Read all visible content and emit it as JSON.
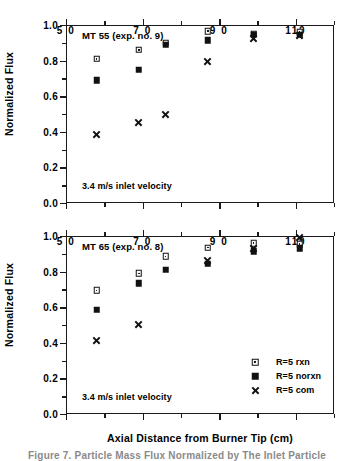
{
  "figure": {
    "caption": "Figure 7. Particle Mass Flux Normalized by The Inlet Particle",
    "xlabel": "Axial  Distance  from  Burner  Tip (cm)",
    "ylabel": "Normalized  Flux"
  },
  "legend": {
    "position": "bottom-right-inside",
    "entries": [
      {
        "label": "R=5 rxn",
        "marker": "open-square"
      },
      {
        "label": "R=5 norxn",
        "marker": "filled-square"
      },
      {
        "label": "R=5 com",
        "marker": "cross-x"
      }
    ]
  },
  "axis": {
    "x_ticks_labeled": [
      "5 0",
      "7 0",
      "9 0",
      "110"
    ],
    "x_tick_values": [
      50,
      70,
      90,
      110
    ],
    "y_ticks_labeled": [
      "0.0",
      "0.2",
      "0.4",
      "0.6",
      "0.8",
      "1.0"
    ],
    "y_tick_values": [
      0.0,
      0.2,
      0.4,
      0.6,
      0.8,
      1.0
    ]
  },
  "chart_data": [
    {
      "type": "scatter",
      "title": "MT 55 (exp. no. 9)",
      "annotation": "3.4 m/s inlet velocity",
      "xlabel": "Axial  Distance  from  Burner  Tip (cm)",
      "ylabel": "Normalized  Flux",
      "xlim": [
        50,
        120
      ],
      "ylim": [
        0.0,
        1.0
      ],
      "grid": false,
      "x": [
        58,
        69,
        76,
        87,
        99,
        111
      ],
      "series": [
        {
          "name": "R=5 rxn",
          "marker": "open-square",
          "values": [
            0.81,
            0.86,
            0.9,
            0.965,
            0.95,
            0.96
          ]
        },
        {
          "name": "R=5 norxn",
          "marker": "filled-square",
          "values": [
            0.69,
            0.75,
            0.89,
            0.915,
            0.945,
            0.945
          ]
        },
        {
          "name": "R=5 com",
          "marker": "cross-x",
          "values": [
            0.385,
            0.455,
            0.5,
            0.795,
            0.925,
            0.94
          ]
        }
      ]
    },
    {
      "type": "scatter",
      "title": "MT 65 (exp. no. 8)",
      "annotation": "3.4 m/s inlet velocity",
      "xlabel": "Axial  Distance  from  Burner  Tip (cm)",
      "ylabel": "Normalized  Flux",
      "xlim": [
        50,
        120
      ],
      "ylim": [
        0.0,
        1.0
      ],
      "grid": false,
      "x": [
        58,
        69,
        76,
        87,
        99,
        111
      ],
      "series": [
        {
          "name": "R=5 rxn",
          "marker": "open-square",
          "values": [
            0.695,
            0.79,
            0.885,
            0.935,
            0.96,
            0.955
          ]
        },
        {
          "name": "R=5 norxn",
          "marker": "filled-square",
          "values": [
            0.585,
            0.735,
            0.81,
            0.845,
            0.915,
            0.93
          ]
        },
        {
          "name": "R=5 com",
          "marker": "cross-x",
          "values": [
            0.415,
            0.505,
            null,
            0.865,
            0.93,
            0.99
          ]
        }
      ]
    }
  ]
}
